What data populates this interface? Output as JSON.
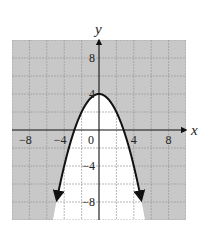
{
  "chart_data": {
    "type": "line",
    "title": "",
    "xlabel": "x",
    "ylabel": "y",
    "xlim": [
      -10,
      10
    ],
    "ylim": [
      -10,
      10
    ],
    "grid": true,
    "grid_step": 2,
    "x_ticks": [
      -8,
      -4,
      0,
      4,
      8
    ],
    "x_tick_labels": [
      "−8",
      "−4",
      "0",
      "4",
      "8"
    ],
    "y_ticks": [
      8,
      4,
      -4,
      -8
    ],
    "y_tick_labels": [
      "8",
      "4",
      "−4",
      "−8"
    ],
    "series": [
      {
        "name": "boundary parabola",
        "equation": "y = 4 - x^2/2",
        "vertex": [
          0,
          4
        ],
        "x_intercepts": [
          -2.83,
          2.83
        ],
        "x": [
          -4.8,
          -4,
          -3,
          -2,
          -1,
          0,
          1,
          2,
          3,
          4,
          4.8
        ],
        "values": [
          -7.5,
          -4,
          -0.5,
          2,
          3.5,
          4,
          3.5,
          2,
          -0.5,
          -4,
          -7.5
        ],
        "style": "solid",
        "arrows_at_ends": true
      }
    ],
    "shading": {
      "shaded_region": "outside parabola (y > 4 - x^2/2)",
      "unshaded_region": "inside parabola (y < 4 - x^2/2)",
      "shade_color": "#c8c8c8",
      "unshaded_color": "#ffffff"
    },
    "colors": {
      "curve": "#111111",
      "axes": "#111111",
      "grid": "#9a9a9a"
    }
  }
}
